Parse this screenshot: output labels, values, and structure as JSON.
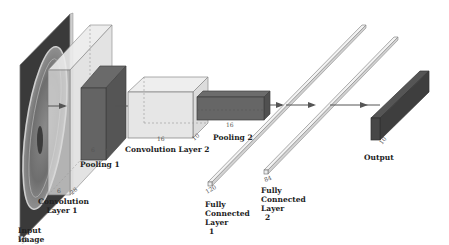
{
  "diagram": {
    "colors": {
      "background": "#ffffff",
      "light_block": "#e4e4e4",
      "dark_block": "#555555",
      "output_block": "#3c3c3c",
      "edge": "#6a6a6a",
      "arrow": "#555555"
    },
    "layers": [
      {
        "id": "input",
        "label_lines": [
          "Input",
          "Image"
        ],
        "dims": [
          "32"
        ]
      },
      {
        "id": "conv1",
        "label_lines": [
          "Convolution",
          "Layer 1"
        ],
        "dims": [
          "6",
          "28"
        ]
      },
      {
        "id": "pool1",
        "label_lines": [
          "Pooling 1"
        ],
        "dims": [
          "6",
          "14"
        ]
      },
      {
        "id": "conv2",
        "label_lines": [
          "Convolution Layer 2"
        ],
        "dims": [
          "16",
          "10"
        ]
      },
      {
        "id": "pool2",
        "label_lines": [
          "Pooling 2"
        ],
        "dims": [
          "16",
          "5"
        ]
      },
      {
        "id": "fc1",
        "label_lines": [
          "Fully",
          "Connected",
          "Layer",
          "1"
        ],
        "dims": [
          "120"
        ]
      },
      {
        "id": "fc2",
        "label_lines": [
          "Fully",
          "Connected",
          "Layer",
          "2"
        ],
        "dims": [
          "84"
        ]
      },
      {
        "id": "output",
        "label_lines": [
          "Output"
        ],
        "dims": [
          "10"
        ]
      }
    ]
  }
}
